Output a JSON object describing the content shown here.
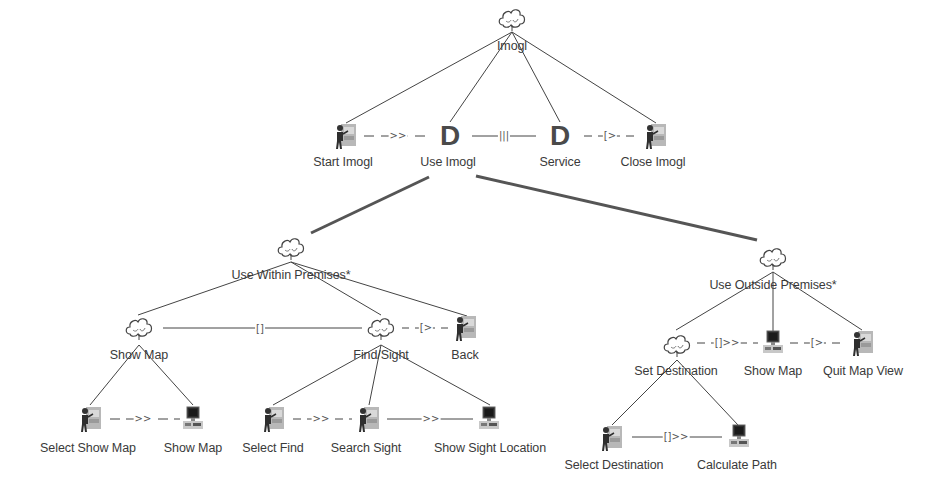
{
  "diagram": {
    "type": "ctt-task-model",
    "root": {
      "id": "imogl",
      "label": "Imogl",
      "icon": "cloud-icon"
    },
    "level1": [
      {
        "id": "start-imogl",
        "label": "Start Imogl",
        "icon": "user-task-icon"
      },
      {
        "id": "use-imogl",
        "label": "Use Imogl",
        "icon": "decision-d-icon",
        "glyph": "D"
      },
      {
        "id": "service",
        "label": "Service",
        "icon": "decision-d-icon",
        "glyph": "D"
      },
      {
        "id": "close-imogl",
        "label": "Close Imogl",
        "icon": "user-task-icon"
      }
    ],
    "level1_operators": [
      ">>",
      "|||",
      "[>"
    ],
    "within": {
      "label": "Use Within Premises*",
      "icon": "cloud-icon",
      "children": [
        {
          "id": "show-map-abs",
          "label": "Show Map",
          "icon": "cloud-icon"
        },
        {
          "id": "find-sight",
          "label": "Find/Sight",
          "icon": "cloud-icon"
        },
        {
          "id": "back",
          "label": "Back",
          "icon": "user-task-icon"
        }
      ],
      "operators": [
        "[]",
        "[>"
      ],
      "show_map_children": [
        {
          "label": "Select Show Map",
          "icon": "user-task-icon"
        },
        {
          "label": "Show Map",
          "icon": "computer-task-icon"
        }
      ],
      "show_map_operators": [
        ">>"
      ],
      "find_sight_children": [
        {
          "label": "Select Find",
          "icon": "user-task-icon"
        },
        {
          "label": "Search Sight",
          "icon": "user-task-icon"
        },
        {
          "label": "Show Sight Location",
          "icon": "computer-task-icon"
        }
      ],
      "find_sight_operators": [
        ">>",
        ">>"
      ]
    },
    "outside": {
      "label": "Use Outside Premises*",
      "icon": "cloud-icon",
      "children": [
        {
          "id": "set-destination",
          "label": "Set Destination",
          "icon": "cloud-icon"
        },
        {
          "id": "show-map-out",
          "label": "Show Map",
          "icon": "computer-task-icon"
        },
        {
          "id": "quit-map-view",
          "label": "Quit Map View",
          "icon": "user-task-icon"
        }
      ],
      "operators": [
        "[]>>",
        "[>"
      ],
      "set_destination_children": [
        {
          "label": "Select Destination",
          "icon": "user-task-icon"
        },
        {
          "label": "Calculate Path",
          "icon": "computer-task-icon"
        }
      ],
      "set_destination_operators": [
        "[]>>"
      ]
    },
    "colors": {
      "line": "#444444",
      "thick_line": "#555555",
      "text": "#3a3a3a",
      "background": "#ffffff"
    }
  }
}
